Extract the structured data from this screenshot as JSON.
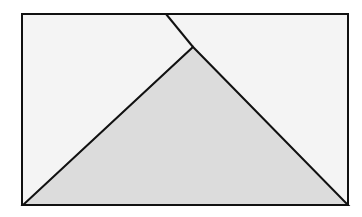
{
  "diagram": {
    "width": 362,
    "height": 217,
    "colors": {
      "page_background": "#ffffff",
      "rectangle_fill": "#f4f4f4",
      "triangle_fill": "#dcdcdc",
      "stroke": "#111111"
    },
    "rectangle": {
      "x": 22,
      "y": 14,
      "width": 326,
      "height": 191,
      "stroke_width": 2
    },
    "triangle": {
      "points": [
        [
          23,
          205
        ],
        [
          193,
          47
        ],
        [
          348,
          205
        ]
      ],
      "stroke_width": 2
    },
    "fold_line": {
      "x1": 166,
      "y1": 14,
      "x2": 193,
      "y2": 47,
      "stroke_width": 2
    },
    "labels": []
  }
}
